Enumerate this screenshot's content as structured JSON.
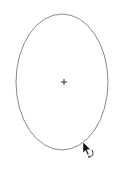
{
  "canvas": {
    "width": 121,
    "height": 172,
    "background": "#ffffff"
  },
  "shape": {
    "type": "ellipse",
    "cx": 62,
    "cy": 82,
    "rx": 46,
    "ry": 68,
    "stroke": "#8a8a8a",
    "stroke_width": 1
  },
  "center_marker": {
    "icon": "crosshair-icon",
    "x": 64,
    "y": 82,
    "size": 3,
    "color": "#333333"
  },
  "cursor": {
    "icon": "rotate-cursor-icon",
    "x": 83,
    "y": 142,
    "color": "#111111"
  }
}
